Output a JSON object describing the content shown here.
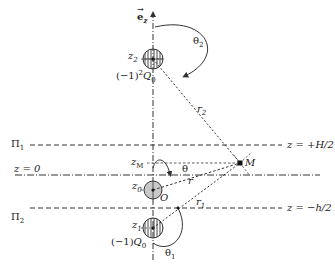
{
  "diagram": {
    "axis_label": "e",
    "axis_label_sub": "z",
    "charges": {
      "top": {
        "level": "z",
        "level_sub": "2",
        "charge_prefix": "(−1)",
        "charge_exp": "2",
        "charge_q": "Q",
        "charge_sub": "0",
        "angle": "θ",
        "angle_sub": "2",
        "distance": "r",
        "distance_sub": "2"
      },
      "center": {
        "level": "z",
        "level_sub": "0",
        "origin": "O",
        "angle": "θ",
        "distance": "r"
      },
      "bottom": {
        "level": "z",
        "level_sub": "1",
        "charge_prefix": "(−1)",
        "charge_q": "Q",
        "charge_sub": "0",
        "angle": "θ",
        "angle_sub": "1",
        "distance": "r",
        "distance_sub": "1"
      }
    },
    "point": {
      "label": "M",
      "level": "z",
      "level_sub": "M"
    },
    "planes": {
      "p1": {
        "name": "Π",
        "name_sub": "1",
        "equation": "z = +H/2"
      },
      "p0": {
        "equation": "z = 0"
      },
      "p2": {
        "name": "Π",
        "name_sub": "2",
        "equation": "z = −h/2"
      }
    },
    "colors": {
      "line": "#333333",
      "fill_center": "#c8c8c8"
    }
  }
}
